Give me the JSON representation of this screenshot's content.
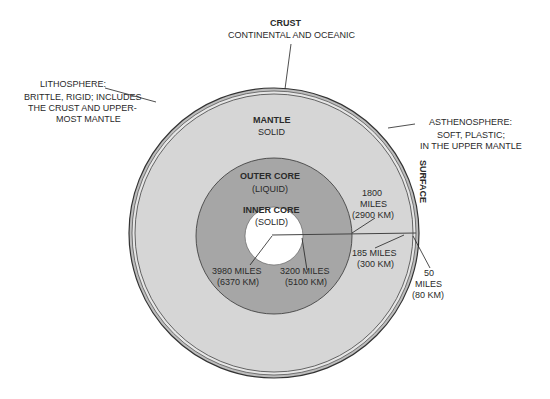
{
  "crust": {
    "title": "CRUST",
    "desc": "CONTINENTAL  AND OCEANIC"
  },
  "lithosphere": {
    "title": "LITHOSPHERE:",
    "lines": [
      "BRITTLE, RIGID; INCLUDES",
      "THE CRUST AND UPPER-",
      "MOST MANTLE"
    ]
  },
  "asthenosphere": {
    "title": "ASTHENOSPHERE:",
    "lines": [
      "SOFT, PLASTIC;",
      "IN THE UPPER MANTLE"
    ]
  },
  "mantle": {
    "title": "MANTLE",
    "desc": "SOLID"
  },
  "outer_core": {
    "title": "OUTER CORE",
    "desc": "(LIQUID)"
  },
  "inner_core": {
    "title": "INNER CORE",
    "desc": "(SOLID)"
  },
  "surface": "SURFACE",
  "depths": {
    "d1800": [
      "1800",
      "MILES",
      "(2900 KM)"
    ],
    "d185": [
      "185 MILES",
      "(300 KM)"
    ],
    "d50": [
      "50",
      "MILES",
      "(80 KM)"
    ],
    "d3980": [
      "3980 MILES",
      "(6370 KM)"
    ],
    "d3200": [
      "3200 MILES",
      "(5100 KM)"
    ]
  },
  "colors": {
    "mantle": "#d6d6d6",
    "outer_core": "#a6a6a6",
    "inner_core": "#ffffff",
    "line": "#3a3a3a"
  }
}
